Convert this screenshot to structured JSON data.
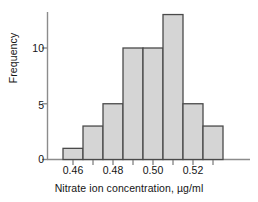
{
  "chart_data": {
    "type": "bar",
    "title": "",
    "subtitle": "",
    "xlabel": "Nitrate ion concentration, µg/ml",
    "ylabel": "Frequency",
    "bin_width": 0.01,
    "bin_edges": [
      0.455,
      0.465,
      0.475,
      0.485,
      0.495,
      0.505,
      0.515,
      0.525,
      0.535
    ],
    "categories": [
      "0.455-0.465",
      "0.465-0.475",
      "0.475-0.485",
      "0.485-0.495",
      "0.495-0.505",
      "0.505-0.515",
      "0.515-0.525",
      "0.525-0.535"
    ],
    "bin_centers": [
      0.46,
      0.47,
      0.48,
      0.49,
      0.5,
      0.51,
      0.52,
      0.53
    ],
    "values": [
      1,
      3,
      5,
      10,
      10,
      13,
      5,
      3
    ],
    "total_count": 50,
    "xlim": [
      0.4505,
      0.5395
    ],
    "ylim": [
      0,
      13.8
    ],
    "xticks": [
      0.46,
      0.48,
      0.5,
      0.52
    ],
    "xtick_labels": [
      "0.46",
      "0.48",
      "0.50",
      "0.52"
    ],
    "xtick_minor": [
      0.47,
      0.49,
      0.51,
      0.53
    ],
    "yticks": [
      0,
      5,
      10
    ],
    "ytick_labels": [
      "0",
      "5",
      "10"
    ],
    "grid": false,
    "legend": null,
    "bar_fill_color": "#d5d5d5",
    "bar_edge_color": "#4a4a4a",
    "axis_color": "#8c8c8c",
    "text_color": "#141414"
  }
}
